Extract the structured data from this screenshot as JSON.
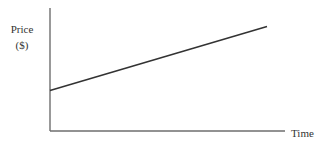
{
  "chart_data": {
    "type": "line",
    "title": "",
    "xlabel": "Time",
    "ylabel": "Price",
    "ylabel_unit": "($)",
    "xlim": [
      0,
      1
    ],
    "ylim": [
      0,
      1
    ],
    "grid": false,
    "legend": "none",
    "x_ticks": [],
    "y_ticks": [],
    "series": [
      {
        "name": "Price",
        "x": [
          0,
          1
        ],
        "y": [
          0.33,
          0.85
        ]
      }
    ]
  }
}
